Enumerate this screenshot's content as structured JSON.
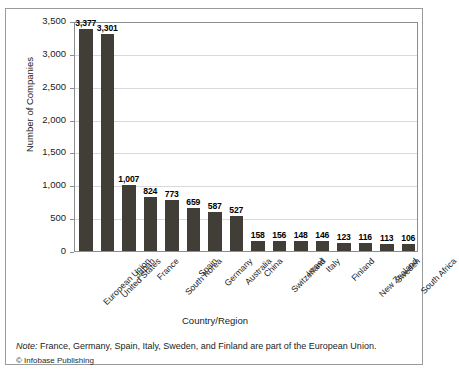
{
  "chart_data": {
    "type": "bar",
    "title": "",
    "xlabel": "Country/Region",
    "ylabel": "Number of Companies",
    "ylim": [
      0,
      3500
    ],
    "ytick_step": 500,
    "grid": true,
    "legend": null,
    "bar_color": "#413e38",
    "categories": [
      "European Union",
      "United States",
      "Japan",
      "France",
      "South Korea",
      "Spain",
      "Germany",
      "Australia",
      "China",
      "Switzerland",
      "Israel",
      "Italy",
      "Finland",
      "New Zealand",
      "Sweden",
      "South Africa"
    ],
    "values": [
      3377,
      3301,
      1007,
      824,
      773,
      659,
      587,
      527,
      158,
      156,
      148,
      146,
      123,
      116,
      113,
      106
    ],
    "value_labels": [
      "3,377",
      "3,301",
      "1,007",
      "824",
      "773",
      "659",
      "587",
      "527",
      "158",
      "156",
      "148",
      "146",
      "123",
      "116",
      "113",
      "106"
    ],
    "ytick_labels": [
      "0",
      "500",
      "1,000",
      "1,500",
      "2,000",
      "2,500",
      "3,000",
      "3,500"
    ],
    "ytick_values": [
      0,
      500,
      1000,
      1500,
      2000,
      2500,
      3000,
      3500
    ]
  },
  "footer": {
    "note_prefix": "Note:",
    "note_text": "France, Germany, Spain, Italy, Sweden, and Finland are part of the European Union.",
    "credit": "© Infobase Publishing"
  }
}
